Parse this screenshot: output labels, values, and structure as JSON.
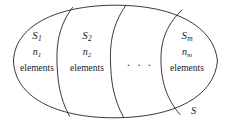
{
  "diagram": {
    "type": "set-partition-venn",
    "universe": {
      "symbol": "S",
      "shape": "ellipse"
    },
    "regions": [
      {
        "set_symbol": "S",
        "set_subscript": "1",
        "count_symbol": "n",
        "count_subscript": "1",
        "elements_word": "elements"
      },
      {
        "set_symbol": "S",
        "set_subscript": "2",
        "count_symbol": "n",
        "count_subscript": "2",
        "elements_word": "elements"
      },
      {
        "set_symbol": "S",
        "set_subscript": "m",
        "count_symbol": "n",
        "count_subscript": "m",
        "elements_word": "elements"
      }
    ],
    "ellipsis": ". . .",
    "colors": {
      "stroke": "#222222",
      "background": "#ffffff",
      "text": "#1a1a1a"
    }
  }
}
